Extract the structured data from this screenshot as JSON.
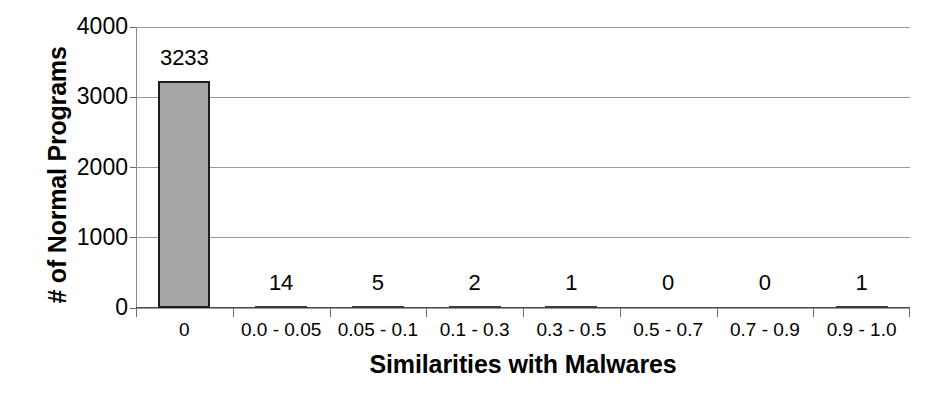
{
  "chart_data": {
    "type": "bar",
    "title": "",
    "xlabel": "Similarities with Malwares",
    "ylabel": "# of Normal Programs",
    "categories": [
      "0",
      "0.0 - 0.05",
      "0.05 - 0.1",
      "0.1 - 0.3",
      "0.3 - 0.5",
      "0.5 - 0.7",
      "0.7 - 0.9",
      "0.9 - 1.0"
    ],
    "values": [
      3233,
      14,
      5,
      2,
      1,
      0,
      0,
      1
    ],
    "data_labels": [
      "3233",
      "14",
      "5",
      "2",
      "1",
      "0",
      "0",
      "1"
    ],
    "ylim": [
      0,
      4000
    ],
    "ytick_values": [
      4000,
      3000,
      2000,
      1000,
      0
    ],
    "ytick_labels": [
      "4000",
      "3000",
      "2000",
      "1000",
      "0"
    ],
    "grid": true,
    "grid_axis": "y",
    "legend": false,
    "legend_position": "none",
    "bar_fill_color": "#a6a6a6",
    "bar_border_color": "#1d1d1d",
    "gridline_color": "#9a9a9a",
    "background_color": "#ffffff",
    "text_color": "#000000"
  }
}
